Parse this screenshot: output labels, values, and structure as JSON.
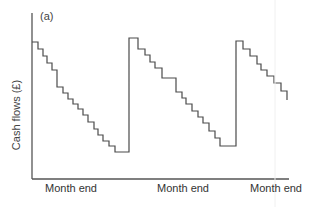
{
  "chart_data": {
    "type": "line",
    "subtype": "step-sawtooth",
    "title": "",
    "panel_label": "(a)",
    "xlabel": "",
    "ylabel": "Cash flows (£)",
    "xtick_labels": [
      "Month end",
      "Month end",
      "Month end"
    ],
    "xtick_positions_px": [
      71,
      183,
      276
    ],
    "grid": false,
    "legend": null,
    "axes_px": {
      "origin": [
        32,
        179
      ],
      "y_top": 13,
      "x_right": 289
    },
    "series": [
      {
        "name": "Cash balance",
        "color": "#4a4a4a",
        "points_px": [
          [
            32,
            42
          ],
          [
            38,
            42
          ],
          [
            38,
            49
          ],
          [
            43,
            49
          ],
          [
            43,
            56
          ],
          [
            47,
            56
          ],
          [
            47,
            63
          ],
          [
            52,
            63
          ],
          [
            52,
            70
          ],
          [
            57,
            70
          ],
          [
            57,
            87
          ],
          [
            63,
            87
          ],
          [
            63,
            93
          ],
          [
            68,
            93
          ],
          [
            68,
            99
          ],
          [
            73,
            99
          ],
          [
            73,
            104
          ],
          [
            78,
            104
          ],
          [
            78,
            109
          ],
          [
            83,
            109
          ],
          [
            83,
            115
          ],
          [
            88,
            115
          ],
          [
            88,
            122
          ],
          [
            94,
            122
          ],
          [
            94,
            129
          ],
          [
            98,
            129
          ],
          [
            98,
            135
          ],
          [
            103,
            135
          ],
          [
            103,
            141
          ],
          [
            109,
            141
          ],
          [
            109,
            146
          ],
          [
            115,
            146
          ],
          [
            115,
            152
          ],
          [
            122,
            152
          ],
          [
            122,
            152
          ],
          [
            129,
            152
          ],
          [
            129,
            38
          ],
          [
            138,
            38
          ],
          [
            138,
            49
          ],
          [
            145,
            49
          ],
          [
            145,
            55
          ],
          [
            150,
            55
          ],
          [
            150,
            62
          ],
          [
            155,
            62
          ],
          [
            155,
            68
          ],
          [
            162,
            68
          ],
          [
            162,
            78
          ],
          [
            176,
            78
          ],
          [
            176,
            92
          ],
          [
            182,
            92
          ],
          [
            182,
            98
          ],
          [
            186,
            98
          ],
          [
            186,
            104
          ],
          [
            192,
            104
          ],
          [
            192,
            111
          ],
          [
            198,
            111
          ],
          [
            198,
            117
          ],
          [
            203,
            117
          ],
          [
            203,
            123
          ],
          [
            209,
            123
          ],
          [
            209,
            131
          ],
          [
            215,
            131
          ],
          [
            215,
            138
          ],
          [
            220,
            138
          ],
          [
            220,
            146
          ],
          [
            236,
            146
          ],
          [
            236,
            41
          ],
          [
            243,
            41
          ],
          [
            243,
            49
          ],
          [
            250,
            49
          ],
          [
            250,
            56
          ],
          [
            257,
            56
          ],
          [
            257,
            64
          ],
          [
            261,
            64
          ],
          [
            261,
            70
          ],
          [
            267,
            70
          ],
          [
            267,
            76
          ],
          [
            274,
            76
          ],
          [
            274,
            83
          ],
          [
            281,
            83
          ],
          [
            281,
            91
          ],
          [
            287,
            91
          ],
          [
            287,
            100
          ]
        ]
      }
    ]
  }
}
